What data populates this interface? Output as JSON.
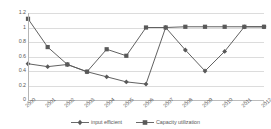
{
  "chart_data": {
    "type": "line",
    "title": "",
    "xlabel": "",
    "ylabel": "",
    "categories": [
      "2000",
      "2001",
      "2002",
      "2003",
      "2004",
      "2005",
      "2006",
      "2007",
      "2008",
      "2009",
      "2010",
      "2011",
      "2012"
    ],
    "ylim": [
      0,
      1.2
    ],
    "ytick_values": [
      0,
      0.2,
      0.4,
      0.6,
      0.8,
      1,
      1.2
    ],
    "ytick_labels": [
      "0",
      "0.2",
      "0.4",
      "0.6",
      "0.8",
      "1",
      "1.2"
    ],
    "grid": true,
    "legend_position": "bottom",
    "series": [
      {
        "name": "input efficient",
        "marker": "diamond",
        "color": "#595959",
        "values": [
          0.5,
          0.46,
          0.49,
          0.39,
          0.32,
          0.25,
          0.22,
          1.0,
          0.69,
          0.4,
          0.67,
          1.01,
          1.01
        ]
      },
      {
        "name": "Capacity utilization",
        "marker": "square",
        "color": "#595959",
        "values": [
          1.12,
          0.73,
          0.49,
          0.39,
          0.7,
          0.61,
          1.0,
          1.0,
          1.01,
          1.01,
          1.01,
          1.01,
          1.01
        ]
      }
    ]
  },
  "legend": {
    "entries": [
      {
        "label": "input efficient"
      },
      {
        "label": "Capacity utilization"
      }
    ]
  }
}
